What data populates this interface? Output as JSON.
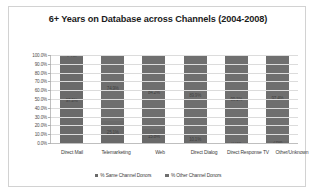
{
  "chart_data": {
    "type": "bar",
    "subtype": "100% stacked column",
    "title": "6+ Years on Database across Channels (2004-2008)",
    "xlabel": "",
    "ylabel": "",
    "ylim": [
      0,
      100
    ],
    "ytick_labels": [
      "100.0%",
      "90.0%",
      "80.0%",
      "70.0%",
      "60.0%",
      "50.0%",
      "40.0%",
      "30.0%",
      "20.0%",
      "10.0%",
      "0.0%"
    ],
    "ytick_values": [
      100,
      90,
      80,
      70,
      60,
      50,
      40,
      30,
      20,
      10,
      0
    ],
    "grid": true,
    "legend_position": "bottom",
    "categories": [
      "Direct Mail",
      "Telemarketing",
      "Web",
      "Direct Dialog",
      "Direct Response TV",
      "Other/Unknown"
    ],
    "series": [
      {
        "name": "% Same Channel Donors",
        "color": "#6a6a6a",
        "values": [
          97.3,
          25.1,
          15.8,
          10.1,
          0.9,
          2.6
        ],
        "labels": [
          "97.3%",
          "25.1%",
          "15.8%",
          "10.1%",
          "0.9%",
          "2.6%"
        ]
      },
      {
        "name": "% Other Channel Donors",
        "color": "#6f6f6f",
        "values": [
          2.7,
          74.9,
          84.2,
          89.9,
          99.1,
          97.4
        ],
        "labels": [
          "2.7%",
          "74.9%",
          "84.2%",
          "89.9%",
          "99.1%",
          "97.4%"
        ]
      }
    ]
  },
  "legend": {
    "entries": [
      {
        "label": "% Same Channel Donors"
      },
      {
        "label": "% Other Channel Donors"
      }
    ]
  }
}
